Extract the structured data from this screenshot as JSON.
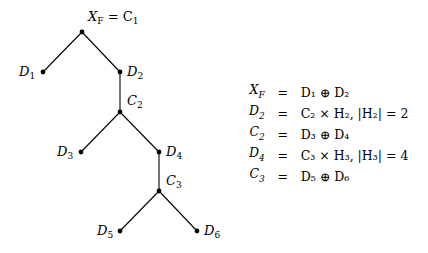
{
  "tree": {
    "nodes": [
      {
        "id": "root",
        "label": "X_F = C_1",
        "x": 82,
        "y": 32
      },
      {
        "id": "D1",
        "label": "D_1",
        "x": 43,
        "y": 72
      },
      {
        "id": "D2",
        "label": "D_2",
        "x": 120,
        "y": 72
      },
      {
        "id": "C2",
        "label": "C_2",
        "x": 120,
        "y": 112
      },
      {
        "id": "D3",
        "label": "D_3",
        "x": 81,
        "y": 152
      },
      {
        "id": "D4",
        "label": "D_4",
        "x": 159,
        "y": 152
      },
      {
        "id": "C3",
        "label": "C_3",
        "x": 159,
        "y": 191
      },
      {
        "id": "D5",
        "label": "D_5",
        "x": 120,
        "y": 231
      },
      {
        "id": "D6",
        "label": "D_6",
        "x": 197,
        "y": 231
      }
    ],
    "edges": [
      [
        "root",
        "D1"
      ],
      [
        "root",
        "D2"
      ],
      [
        "D2",
        "C2"
      ],
      [
        "C2",
        "D3"
      ],
      [
        "C2",
        "D4"
      ],
      [
        "D4",
        "C3"
      ],
      [
        "C3",
        "D5"
      ],
      [
        "C3",
        "D6"
      ]
    ],
    "labels": {
      "root": {
        "main": "X",
        "sub": "F",
        "rest": " = C",
        "rest_sub": "1"
      },
      "D1": {
        "main": "D",
        "sub": "1"
      },
      "D2": {
        "main": "D",
        "sub": "2"
      },
      "C2": {
        "main": "C",
        "sub": "2"
      },
      "D3": {
        "main": "D",
        "sub": "3"
      },
      "D4": {
        "main": "D",
        "sub": "4"
      },
      "C3": {
        "main": "C",
        "sub": "3"
      },
      "D5": {
        "main": "D",
        "sub": "5"
      },
      "D6": {
        "main": "D",
        "sub": "6"
      }
    }
  },
  "equations": [
    {
      "lhs": "X",
      "lhs_sub": "F",
      "op": "=",
      "rhs": "D₁ ⊕ D₂"
    },
    {
      "lhs": "D",
      "lhs_sub": "2",
      "op": "=",
      "rhs": "C₂ × H₂,  |H₂| = 2"
    },
    {
      "lhs": "C",
      "lhs_sub": "2",
      "op": "=",
      "rhs": "D₃ ⊕ D₄"
    },
    {
      "lhs": "D",
      "lhs_sub": "4",
      "op": "=",
      "rhs": "C₃ × H₃,  |H₃| = 4"
    },
    {
      "lhs": "C",
      "lhs_sub": "3",
      "op": "=",
      "rhs": "D₅ ⊕ D₆"
    }
  ],
  "colors": {
    "line": "#000000",
    "node": "#000000",
    "background": "#ffffff"
  }
}
